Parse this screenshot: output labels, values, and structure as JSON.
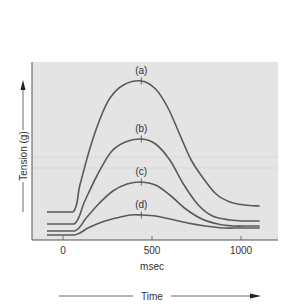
{
  "chart_data": {
    "type": "line",
    "title": "",
    "xlabel": "msec",
    "ylabel": "Tension (g)",
    "bottom_arrow_label": "Time",
    "xlim": [
      -175,
      1210
    ],
    "ylim": [
      0,
      180
    ],
    "x_ticks": [
      0,
      500,
      1000
    ],
    "x_tick_labels": [
      "0",
      "500",
      "1000"
    ],
    "grid": false,
    "legend": "inline labels above peaks",
    "series": [
      {
        "name": "(a)",
        "peak_x": 440,
        "points": [
          [
            -90,
            28
          ],
          [
            56,
            28
          ],
          [
            95,
            55
          ],
          [
            152,
            92
          ],
          [
            210,
            122
          ],
          [
            264,
            142
          ],
          [
            340,
            155
          ],
          [
            440,
            159
          ],
          [
            520,
            151
          ],
          [
            590,
            132
          ],
          [
            657,
            105
          ],
          [
            720,
            80
          ],
          [
            787,
            62
          ],
          [
            860,
            46
          ],
          [
            938,
            38
          ],
          [
            1020,
            35
          ],
          [
            1105,
            34
          ]
        ]
      },
      {
        "name": "(b)",
        "peak_x": 440,
        "points": [
          [
            -90,
            16
          ],
          [
            62,
            16
          ],
          [
            120,
            38
          ],
          [
            190,
            64
          ],
          [
            270,
            88
          ],
          [
            350,
            98
          ],
          [
            440,
            101
          ],
          [
            520,
            96
          ],
          [
            600,
            80
          ],
          [
            680,
            55
          ],
          [
            760,
            35
          ],
          [
            840,
            24
          ],
          [
            940,
            20
          ],
          [
            1020,
            19
          ],
          [
            1105,
            19
          ]
        ]
      },
      {
        "name": "(c)",
        "peak_x": 440,
        "points": [
          [
            -90,
            9
          ],
          [
            65,
            9
          ],
          [
            130,
            22
          ],
          [
            200,
            36
          ],
          [
            280,
            49
          ],
          [
            360,
            56
          ],
          [
            440,
            58
          ],
          [
            520,
            55
          ],
          [
            600,
            45
          ],
          [
            690,
            31
          ],
          [
            780,
            21
          ],
          [
            870,
            16
          ],
          [
            960,
            14
          ],
          [
            1040,
            14
          ],
          [
            1105,
            14
          ]
        ]
      },
      {
        "name": "(d)",
        "peak_x": 440,
        "points": [
          [
            -90,
            5
          ],
          [
            65,
            5
          ],
          [
            140,
            12
          ],
          [
            220,
            18
          ],
          [
            300,
            22
          ],
          [
            380,
            25
          ],
          [
            440,
            25
          ],
          [
            520,
            24
          ],
          [
            600,
            21
          ],
          [
            700,
            17
          ],
          [
            800,
            14
          ],
          [
            900,
            12
          ],
          [
            1000,
            12
          ],
          [
            1105,
            12
          ]
        ]
      }
    ]
  },
  "plot": {
    "left_px": 32,
    "top_px": 62,
    "right_px": 278,
    "bottom_px": 240,
    "x0_px": 63,
    "px_per_ms": 0.178,
    "y0_px": 240,
    "px_per_unit": 1.0
  },
  "colors": {
    "background": "#e4e4e4",
    "curve": "#5a5a5a",
    "text": "#333333"
  }
}
